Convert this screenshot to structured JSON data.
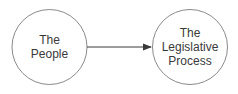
{
  "diagram": {
    "nodes": [
      {
        "id": "people",
        "lines": [
          "The",
          "People"
        ]
      },
      {
        "id": "legislative",
        "lines": [
          "The",
          "Legislative",
          "Process"
        ]
      }
    ],
    "edges": [
      {
        "from": "people",
        "to": "legislative",
        "type": "arrow"
      }
    ],
    "colors": {
      "stroke": "#4a4a4a",
      "text": "#3a3a3a",
      "background": "#ffffff"
    }
  }
}
